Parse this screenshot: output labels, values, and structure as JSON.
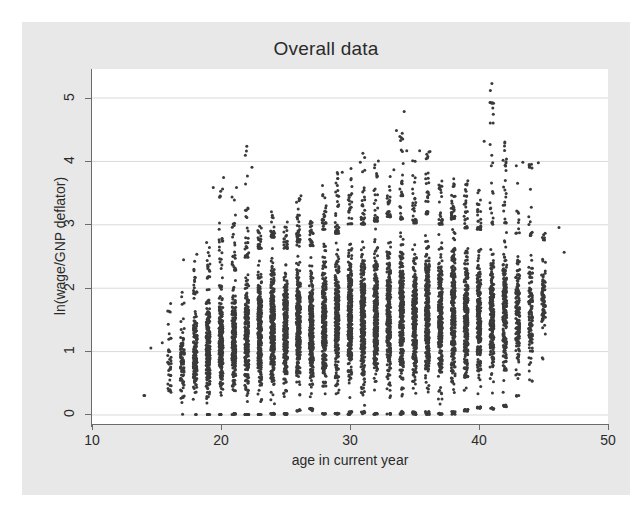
{
  "chart_data": {
    "type": "scatter",
    "title": "Overall data",
    "xlabel": "age in current year",
    "ylabel": "ln(wage/GNP deflator)",
    "xlim": [
      10,
      50
    ],
    "ylim": [
      -0.15,
      5.45
    ],
    "xticks": [
      10,
      20,
      30,
      40,
      50
    ],
    "yticks": [
      0,
      1,
      2,
      3,
      4,
      5
    ],
    "xtick_labels": [
      "10",
      "20",
      "30",
      "40",
      "50"
    ],
    "ytick_labels": [
      "0",
      "1",
      "2",
      "3",
      "4",
      "5"
    ],
    "grid": "horizontal",
    "grid_color": "#d9d9d9",
    "legend": "none",
    "marker_color": "#3a3a3a",
    "marker_size": 1.5,
    "plot_background": "#ffffff",
    "graph_background": "#e8e8e8",
    "series": [
      {
        "name": "observations",
        "columns": [
          {
            "x": 14.0,
            "low": 0.3,
            "high": 0.3,
            "dense_low": 0.3,
            "dense_high": 0.3,
            "n": 2
          },
          {
            "x": 14.6,
            "low": 1.05,
            "high": 1.05,
            "dense_low": 1.05,
            "dense_high": 1.05,
            "n": 1
          },
          {
            "x": 15.4,
            "low": 1.13,
            "high": 1.13,
            "dense_low": 1.13,
            "dense_high": 1.13,
            "n": 1
          },
          {
            "x": 16.0,
            "low": 0.02,
            "high": 1.82,
            "dense_low": 0.05,
            "dense_high": 1.6,
            "n": 40
          },
          {
            "x": 17.0,
            "low": 0.0,
            "high": 2.72,
            "dense_low": 0.02,
            "dense_high": 1.72,
            "n": 90
          },
          {
            "x": 18.0,
            "low": 0.0,
            "high": 2.62,
            "dense_low": 0.0,
            "dense_high": 1.9,
            "n": 170
          },
          {
            "x": 19.0,
            "low": 0.0,
            "high": 2.72,
            "dense_low": 0.0,
            "dense_high": 2.15,
            "n": 230
          },
          {
            "x": 20.0,
            "low": 0.0,
            "high": 3.74,
            "dense_low": 0.0,
            "dense_high": 2.3,
            "n": 260
          },
          {
            "x": 21.0,
            "low": 0.0,
            "high": 3.58,
            "dense_low": 0.02,
            "dense_high": 2.28,
            "n": 280
          },
          {
            "x": 22.0,
            "low": 0.0,
            "high": 4.23,
            "dense_low": 0.0,
            "dense_high": 2.48,
            "n": 300
          },
          {
            "x": 23.0,
            "low": 0.0,
            "high": 3.03,
            "dense_low": 0.0,
            "dense_high": 2.62,
            "n": 310
          },
          {
            "x": 24.0,
            "low": 0.0,
            "high": 3.22,
            "dense_low": 0.02,
            "dense_high": 2.8,
            "n": 320
          },
          {
            "x": 25.0,
            "low": 0.0,
            "high": 3.12,
            "dense_low": 0.02,
            "dense_high": 2.62,
            "n": 320
          },
          {
            "x": 26.0,
            "low": 0.05,
            "high": 3.45,
            "dense_low": 0.08,
            "dense_high": 2.72,
            "n": 320
          },
          {
            "x": 27.0,
            "low": 0.05,
            "high": 3.05,
            "dense_low": 0.1,
            "dense_high": 2.66,
            "n": 310
          },
          {
            "x": 28.0,
            "low": 0.0,
            "high": 3.62,
            "dense_low": 0.02,
            "dense_high": 2.92,
            "n": 320
          },
          {
            "x": 29.0,
            "low": 0.0,
            "high": 3.82,
            "dense_low": 0.02,
            "dense_high": 2.86,
            "n": 320
          },
          {
            "x": 30.0,
            "low": 0.0,
            "high": 3.92,
            "dense_low": 0.05,
            "dense_high": 3.0,
            "n": 330
          },
          {
            "x": 31.0,
            "low": 0.0,
            "high": 4.12,
            "dense_low": 0.05,
            "dense_high": 3.0,
            "n": 330
          },
          {
            "x": 32.0,
            "low": 0.0,
            "high": 4.0,
            "dense_low": 0.02,
            "dense_high": 3.05,
            "n": 330
          },
          {
            "x": 33.0,
            "low": 0.0,
            "high": 3.86,
            "dense_low": 0.02,
            "dense_high": 3.12,
            "n": 320
          },
          {
            "x": 34.0,
            "low": 0.0,
            "high": 4.48,
            "dense_low": 0.05,
            "dense_high": 3.08,
            "n": 320
          },
          {
            "x": 35.0,
            "low": 0.0,
            "high": 4.13,
            "dense_low": 0.05,
            "dense_high": 3.02,
            "n": 320
          },
          {
            "x": 36.0,
            "low": 0.0,
            "high": 4.15,
            "dense_low": 0.05,
            "dense_high": 3.16,
            "n": 320
          },
          {
            "x": 37.0,
            "low": 0.0,
            "high": 3.7,
            "dense_low": 0.02,
            "dense_high": 3.0,
            "n": 310
          },
          {
            "x": 38.0,
            "low": 0.0,
            "high": 3.72,
            "dense_low": 0.05,
            "dense_high": 3.08,
            "n": 300
          },
          {
            "x": 39.0,
            "low": 0.05,
            "high": 3.72,
            "dense_low": 0.08,
            "dense_high": 2.94,
            "n": 290
          },
          {
            "x": 40.0,
            "low": 0.1,
            "high": 3.58,
            "dense_low": 0.12,
            "dense_high": 2.92,
            "n": 270
          },
          {
            "x": 41.0,
            "low": 0.08,
            "high": 5.22,
            "dense_low": 0.12,
            "dense_high": 3.0,
            "n": 250
          },
          {
            "x": 42.0,
            "low": 0.12,
            "high": 4.3,
            "dense_low": 0.15,
            "dense_high": 3.02,
            "n": 220
          },
          {
            "x": 43.0,
            "low": 0.28,
            "high": 3.98,
            "dense_low": 0.32,
            "dense_high": 2.86,
            "n": 180
          },
          {
            "x": 44.0,
            "low": 0.52,
            "high": 3.97,
            "dense_low": 0.56,
            "dense_high": 2.82,
            "n": 130
          },
          {
            "x": 45.0,
            "low": 0.86,
            "high": 3.0,
            "dense_low": 0.9,
            "dense_high": 2.74,
            "n": 80
          }
        ],
        "outliers": [
          {
            "x": 41.0,
            "y": 5.22
          },
          {
            "x": 34.2,
            "y": 4.78
          },
          {
            "x": 33.6,
            "y": 4.48
          },
          {
            "x": 22.0,
            "y": 4.23
          },
          {
            "x": 42.0,
            "y": 4.3
          },
          {
            "x": 40.4,
            "y": 4.31
          },
          {
            "x": 31.0,
            "y": 4.12
          },
          {
            "x": 34.4,
            "y": 4.16
          },
          {
            "x": 35.4,
            "y": 4.16
          },
          {
            "x": 36.2,
            "y": 4.15
          },
          {
            "x": 32.2,
            "y": 4.0
          },
          {
            "x": 30.8,
            "y": 3.98
          },
          {
            "x": 43.4,
            "y": 3.98
          },
          {
            "x": 44.6,
            "y": 3.97
          },
          {
            "x": 22.4,
            "y": 3.9
          },
          {
            "x": 29.4,
            "y": 3.82
          },
          {
            "x": 20.2,
            "y": 3.74
          },
          {
            "x": 33.4,
            "y": 3.86
          },
          {
            "x": 21.2,
            "y": 3.58
          },
          {
            "x": 19.4,
            "y": 3.58
          },
          {
            "x": 26.2,
            "y": 3.45
          },
          {
            "x": 46.2,
            "y": 2.95
          },
          {
            "x": 46.6,
            "y": 2.56
          }
        ]
      }
    ]
  },
  "chart": {
    "title": "Overall data",
    "x_axis_title": "age in current year",
    "y_axis_title": "ln(wage/GNP deflator)"
  }
}
